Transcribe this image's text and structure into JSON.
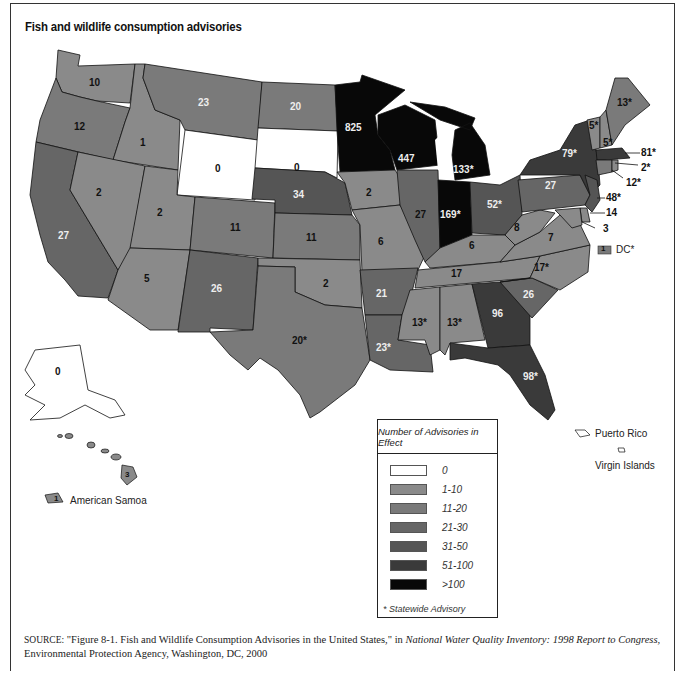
{
  "title": "Fish and wildlife consumption advisories",
  "colors": {
    "c0": "#ffffff",
    "c1": "#8a8a8a",
    "c2": "#7a7a7a",
    "c3": "#666666",
    "c4": "#555555",
    "c5": "#3a3a3a",
    "c6": "#080808"
  },
  "states": [
    {
      "code": "WA",
      "value": "10"
    },
    {
      "code": "OR",
      "value": "12"
    },
    {
      "code": "CA",
      "value": "27"
    },
    {
      "code": "ID",
      "value": "1"
    },
    {
      "code": "NV",
      "value": "2"
    },
    {
      "code": "MT",
      "value": "23"
    },
    {
      "code": "WY",
      "value": "0"
    },
    {
      "code": "UT",
      "value": "2"
    },
    {
      "code": "AZ",
      "value": "5"
    },
    {
      "code": "CO",
      "value": "11"
    },
    {
      "code": "NM",
      "value": "26"
    },
    {
      "code": "ND",
      "value": "20"
    },
    {
      "code": "SD",
      "value": "0"
    },
    {
      "code": "NE",
      "value": "34"
    },
    {
      "code": "KS",
      "value": "11"
    },
    {
      "code": "OK",
      "value": "2"
    },
    {
      "code": "TX",
      "value": "20*"
    },
    {
      "code": "MN",
      "value": "825"
    },
    {
      "code": "IA",
      "value": "2"
    },
    {
      "code": "MO",
      "value": "6"
    },
    {
      "code": "AR",
      "value": "21"
    },
    {
      "code": "LA",
      "value": "23*"
    },
    {
      "code": "WI",
      "value": "447"
    },
    {
      "code": "IL",
      "value": "27"
    },
    {
      "code": "MI",
      "value": "133*"
    },
    {
      "code": "IN",
      "value": "169*"
    },
    {
      "code": "OH",
      "value": "52*"
    },
    {
      "code": "KY",
      "value": "6"
    },
    {
      "code": "TN",
      "value": "17"
    },
    {
      "code": "MS",
      "value": "13*"
    },
    {
      "code": "AL",
      "value": "13*"
    },
    {
      "code": "GA",
      "value": "96"
    },
    {
      "code": "FL",
      "value": "98*"
    },
    {
      "code": "SC",
      "value": "26"
    },
    {
      "code": "NC",
      "value": "17*"
    },
    {
      "code": "VA",
      "value": "7"
    },
    {
      "code": "WV",
      "value": "8"
    },
    {
      "code": "PA",
      "value": "27"
    },
    {
      "code": "NY",
      "value": "79*"
    },
    {
      "code": "VT",
      "value": "5*"
    },
    {
      "code": "NH",
      "value": "5*"
    },
    {
      "code": "ME",
      "value": "13*"
    },
    {
      "code": "MA",
      "value": "81*"
    },
    {
      "code": "RI",
      "value": "2*"
    },
    {
      "code": "CT",
      "value": "12*"
    },
    {
      "code": "NJ",
      "value": "48*"
    },
    {
      "code": "DE",
      "value": "14"
    },
    {
      "code": "MD",
      "value": "3"
    },
    {
      "code": "DC",
      "value": "1"
    },
    {
      "code": "AK",
      "value": "0"
    },
    {
      "code": "HI",
      "value": "3"
    },
    {
      "code": "AS",
      "value": "1"
    }
  ],
  "callouts": {
    "ma": "81*",
    "ri": "2*",
    "ct": "12*",
    "nj": "48*",
    "de": "14",
    "md": "3",
    "dc_value": "1",
    "dc_label": "DC*"
  },
  "territories": {
    "american_samoa": "American Samoa",
    "puerto_rico": "Puerto Rico",
    "virgin_islands": "Virgin Islands"
  },
  "legend": {
    "title": "Number of Advisories in Effect",
    "items": [
      {
        "label": "0",
        "color": "#ffffff"
      },
      {
        "label": "1-10",
        "color": "#8a8a8a"
      },
      {
        "label": "11-20",
        "color": "#7a7a7a"
      },
      {
        "label": "21-30",
        "color": "#666666"
      },
      {
        "label": "31-50",
        "color": "#555555"
      },
      {
        "label": "51-100",
        "color": "#3a3a3a"
      },
      {
        "label": ">100",
        "color": "#080808"
      }
    ],
    "note": "* Statewide Advisory"
  },
  "source": {
    "prefix": "SOURCE:",
    "text1": " \"Figure 8-1. Fish and Wildlife Consumption Advisories in the United States,\" in ",
    "italic": "National Water Quality Inventory: 1998 Report to Congress,",
    "text2": " Environmental Protection Agency, Washington, DC, 2000"
  }
}
